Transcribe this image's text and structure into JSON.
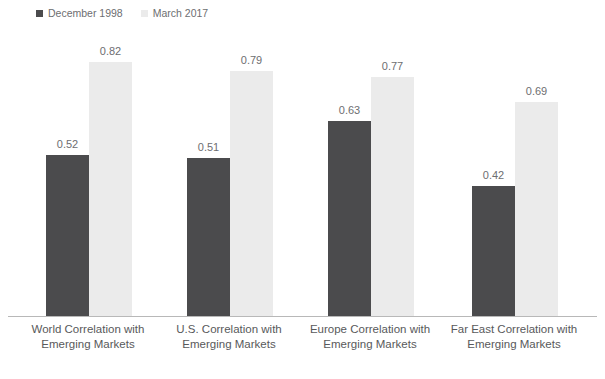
{
  "chart_data": {
    "type": "bar",
    "title": "",
    "subtitle": "",
    "xlabel": "",
    "ylabel": "",
    "ylim": [
      0,
      1.0
    ],
    "grid": false,
    "legend_position": "top-left",
    "value_labels": true,
    "categories": [
      "World Correlation with Emerging Markets",
      "U.S. Correlation with Emerging Markets",
      "Europe Correlation with Emerging Markets",
      "Far East Correlation with Emerging Markets"
    ],
    "category_lines": [
      [
        "World Correlation with",
        "Emerging Markets"
      ],
      [
        "U.S. Correlation with",
        "Emerging Markets"
      ],
      [
        "Europe Correlation with",
        "Emerging Markets"
      ],
      [
        "Far East Correlation with",
        "Emerging Markets"
      ]
    ],
    "series": [
      {
        "name": "December 1998",
        "color": "#4b4b4d",
        "values": [
          0.52,
          0.51,
          0.63,
          0.42
        ],
        "labels": [
          "0.52",
          "0.51",
          "0.63",
          "0.42"
        ]
      },
      {
        "name": "March 2017",
        "color": "#ebebeb",
        "values": [
          0.82,
          0.79,
          0.77,
          0.69
        ],
        "labels": [
          "0.82",
          "0.79",
          "0.77",
          "0.69"
        ]
      }
    ]
  },
  "legend": {
    "items": [
      {
        "label": "December 1998",
        "color": "#4b4b4d"
      },
      {
        "label": "March 2017",
        "color": "#ebebeb"
      }
    ]
  },
  "axis": {
    "baseline_color": "#b8b8b8"
  },
  "geometry": {
    "baseline_y": 316,
    "pixels_per_unit": 310,
    "bar_width": 43,
    "groups": [
      {
        "dark_x": 46,
        "light_x": 89
      },
      {
        "dark_x": 187,
        "light_x": 230
      },
      {
        "dark_x": 328,
        "light_x": 371
      },
      {
        "dark_x": 472,
        "light_x": 515
      }
    ],
    "label_centers": [
      88,
      229,
      370,
      514
    ],
    "label_width": 160
  }
}
